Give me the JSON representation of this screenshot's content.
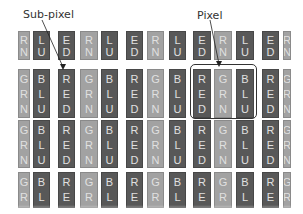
{
  "labels": {
    "subpixel": "Sub-pixel",
    "pixel": "Pixel"
  },
  "colors": {
    "dark_cell": "#585858",
    "light_cell": "#a2a2a2",
    "text": "#e0e0e0",
    "background": "#ffffff"
  },
  "columns": [
    {
      "x": 18,
      "w": 12,
      "tone": "light",
      "text": [
        "G",
        "R",
        "N"
      ]
    },
    {
      "x": 33,
      "w": 17,
      "tone": "dark",
      "text": [
        "B",
        "L",
        "U"
      ]
    },
    {
      "x": 58,
      "w": 17,
      "tone": "dark",
      "text": [
        "R",
        "E",
        "D"
      ]
    },
    {
      "x": 80,
      "w": 18,
      "tone": "light",
      "text": [
        "G",
        "R",
        "N"
      ]
    },
    {
      "x": 101,
      "w": 17,
      "tone": "dark",
      "text": [
        "B",
        "L",
        "U"
      ]
    },
    {
      "x": 126,
      "w": 17,
      "tone": "dark",
      "text": [
        "R",
        "E",
        "D"
      ]
    },
    {
      "x": 147,
      "w": 17,
      "tone": "light",
      "text": [
        "G",
        "R",
        "N"
      ]
    },
    {
      "x": 169,
      "w": 17,
      "tone": "dark",
      "text": [
        "B",
        "L",
        "U"
      ]
    },
    {
      "x": 193,
      "w": 18,
      "tone": "dark",
      "text": [
        "R",
        "E",
        "D"
      ]
    },
    {
      "x": 214,
      "w": 18,
      "tone": "light",
      "text": [
        "G",
        "R",
        "N"
      ]
    },
    {
      "x": 236,
      "w": 18,
      "tone": "dark",
      "text": [
        "B",
        "L",
        "U"
      ]
    },
    {
      "x": 262,
      "w": 17,
      "tone": "dark",
      "text": [
        "R",
        "E",
        "D"
      ]
    },
    {
      "x": 283,
      "w": 8,
      "tone": "light",
      "text": [
        "G",
        "R",
        "N"
      ]
    }
  ],
  "rows": [
    {
      "y": 31,
      "h": 29,
      "offset": 1
    },
    {
      "y": 69,
      "h": 49,
      "offset": 0
    },
    {
      "y": 120,
      "h": 48,
      "offset": 0
    },
    {
      "y": 172,
      "h": 36,
      "offset": 0
    }
  ],
  "pixel_box": {
    "x": 190,
    "y": 64,
    "w": 67,
    "h": 55
  }
}
